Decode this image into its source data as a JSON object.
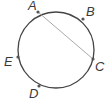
{
  "diagram": {
    "type": "circle-with-chord",
    "circle": {
      "cx": 56,
      "cy": 50,
      "r": 38,
      "stroke": "#444444"
    },
    "chord": {
      "from": "A",
      "to": "C",
      "stroke": "#aaaaaa"
    },
    "points": [
      {
        "name": "A",
        "x": 38,
        "y": 12,
        "label_x": 28,
        "label_y": 10
      },
      {
        "name": "B",
        "x": 83,
        "y": 19,
        "label_x": 86,
        "label_y": 16
      },
      {
        "name": "C",
        "x": 93,
        "y": 59,
        "label_x": 95,
        "label_y": 71
      },
      {
        "name": "D",
        "x": 39,
        "y": 86,
        "label_x": 29,
        "label_y": 98
      },
      {
        "name": "E",
        "x": 18,
        "y": 57,
        "label_x": 4,
        "label_y": 66
      }
    ],
    "point_color": "#555555"
  }
}
